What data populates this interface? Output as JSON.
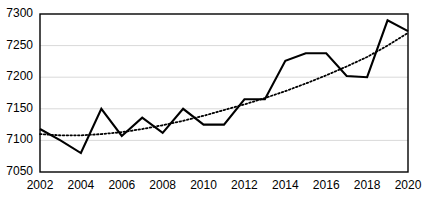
{
  "chart_data": {
    "type": "line",
    "title": "",
    "subtitle": "",
    "xlabel": "",
    "ylabel": "",
    "x": [
      2002,
      2003,
      2004,
      2005,
      2006,
      2007,
      2008,
      2009,
      2010,
      2011,
      2012,
      2013,
      2014,
      2015,
      2016,
      2017,
      2018,
      2019,
      2020
    ],
    "categories": [
      "2002",
      "2003",
      "2004",
      "2005",
      "2006",
      "2007",
      "2008",
      "2009",
      "2010",
      "2011",
      "2012",
      "2013",
      "2014",
      "2015",
      "2016",
      "2017",
      "2018",
      "2019",
      "2020"
    ],
    "series": [
      {
        "name": "value",
        "style": "solid",
        "color": "#000000",
        "values": [
          7118,
          7100,
          7080,
          7150,
          7107,
          7136,
          7112,
          7150,
          7125,
          7125,
          7165,
          7165,
          7226,
          7238,
          7238,
          7202,
          7200,
          7290,
          7273
        ]
      },
      {
        "name": "trendline",
        "style": "dotted",
        "color": "#000000",
        "values": [
          7110,
          7108,
          7108,
          7110,
          7113,
          7118,
          7124,
          7131,
          7139,
          7148,
          7157,
          7167,
          7178,
          7190,
          7203,
          7217,
          7232,
          7250,
          7270
        ]
      }
    ],
    "ylim": [
      7050,
      7300
    ],
    "yticks": [
      7050,
      7100,
      7150,
      7200,
      7250,
      7300
    ],
    "ytick_labels": [
      "7050",
      "7100",
      "7150",
      "7200",
      "7250",
      "7300"
    ],
    "xlim": [
      2002,
      2020
    ],
    "xticks": [
      2002,
      2004,
      2006,
      2008,
      2010,
      2012,
      2014,
      2016,
      2018,
      2020
    ],
    "xtick_labels": [
      "2002",
      "2004",
      "2006",
      "2008",
      "2010",
      "2012",
      "2014",
      "2016",
      "2018",
      "2020"
    ],
    "grid": "horizontal",
    "grid_color": "#d9d9d9",
    "legend": "none",
    "plot_border_color": "#000000",
    "background": "#ffffff"
  }
}
